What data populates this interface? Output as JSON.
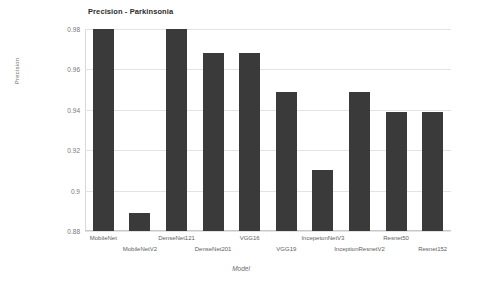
{
  "chart_data": {
    "type": "bar",
    "title": "Precision - Parkinsonia",
    "xlabel": "Model",
    "ylabel": "Precision",
    "ylim": [
      0.88,
      0.98
    ],
    "ytick_labels": [
      "0.98",
      "0.96",
      "0.94",
      "0.92",
      "0.9",
      "0.88"
    ],
    "ytick_values": [
      0.98,
      0.96,
      0.94,
      0.92,
      0.9,
      0.88
    ],
    "grid": true,
    "legend": "none",
    "bar_color": "#3a3a3a",
    "gridline_color": "#e3e3e3",
    "background_color": "#ffffff",
    "categories": [
      "MobileNet",
      "MobileNetV2",
      "DenseNet121",
      "DenseNet201",
      "VGG16",
      "VGG19",
      "IncepetonNetV3",
      "InceptionResnetV2",
      "Resnet50",
      "Resnet152"
    ],
    "values": [
      0.98,
      0.889,
      0.98,
      0.968,
      0.968,
      0.949,
      0.91,
      0.949,
      0.939,
      0.939
    ]
  }
}
